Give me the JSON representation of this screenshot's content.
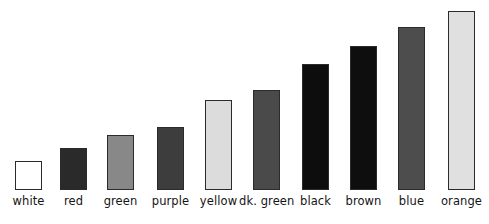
{
  "chart_data": {
    "type": "bar",
    "title": "",
    "subtitle": "",
    "xlabel": "",
    "ylabel": "",
    "grid": false,
    "legend": "none",
    "orientation": "vertical",
    "ylim": [
      0,
      179
    ],
    "categories": [
      "white",
      "red",
      "green",
      "purple",
      "yellow",
      "dk. green",
      "black",
      "brown",
      "blue",
      "orange"
    ],
    "values": [
      29,
      42,
      55,
      63,
      90,
      100,
      126,
      144,
      163,
      179
    ],
    "bar_fill_colors": [
      "#ffffff",
      "#2a2a2a",
      "#888888",
      "#3d3d3d",
      "#dcdcdc",
      "#4a4a4a",
      "#0d0d0d",
      "#0e0e0e",
      "#4d4d4d",
      "#e0e0e0"
    ],
    "bar_outline_color": "#2b2b2b",
    "bar_width_px": 27,
    "bar_left_positions_px": [
      15,
      60,
      107,
      157,
      205,
      253,
      302,
      350,
      398,
      448
    ],
    "baseline_y_px": 190,
    "background_color": "#ffffff",
    "label_color": "#141414",
    "bars": [
      {
        "category": "white",
        "value": 29,
        "fill": "#ffffff",
        "left": 15,
        "top": 161
      },
      {
        "category": "red",
        "value": 42,
        "fill": "#2a2a2a",
        "left": 60,
        "top": 148
      },
      {
        "category": "green",
        "value": 55,
        "fill": "#888888",
        "left": 107,
        "top": 135
      },
      {
        "category": "purple",
        "value": 63,
        "fill": "#3d3d3d",
        "left": 157,
        "top": 127
      },
      {
        "category": "yellow",
        "value": 90,
        "fill": "#dcdcdc",
        "left": 205,
        "top": 100
      },
      {
        "category": "dk. green",
        "value": 100,
        "fill": "#4a4a4a",
        "left": 253,
        "top": 90
      },
      {
        "category": "black",
        "value": 126,
        "fill": "#0d0d0d",
        "left": 302,
        "top": 64
      },
      {
        "category": "brown",
        "value": 144,
        "fill": "#0e0e0e",
        "left": 350,
        "top": 46
      },
      {
        "category": "blue",
        "value": 163,
        "fill": "#4d4d4d",
        "left": 398,
        "top": 27
      },
      {
        "category": "orange",
        "value": 179,
        "fill": "#e0e0e0",
        "left": 448,
        "top": 11
      }
    ]
  }
}
